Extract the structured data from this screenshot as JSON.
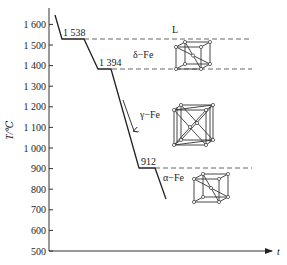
{
  "diagram": {
    "y_axis": {
      "label": "T/℃",
      "range": [
        500,
        1650
      ],
      "ticks": [
        {
          "value": 1600,
          "label": "1 600"
        },
        {
          "value": 1500,
          "label": "1 500"
        },
        {
          "value": 1400,
          "label": "1 400"
        },
        {
          "value": 1300,
          "label": "1 300"
        },
        {
          "value": 1200,
          "label": "1 200"
        },
        {
          "value": 1100,
          "label": "1 100"
        },
        {
          "value": 1000,
          "label": "1 000"
        },
        {
          "value": 900,
          "label": "900"
        },
        {
          "value": 800,
          "label": "800"
        },
        {
          "value": 700,
          "label": "700"
        },
        {
          "value": 600,
          "label": "600"
        },
        {
          "value": 500,
          "label": "500"
        }
      ]
    },
    "x_axis": {
      "label": "t"
    },
    "transitions": [
      {
        "temperature": 1538,
        "label": "1 538"
      },
      {
        "temperature": 1394,
        "label": "1 394"
      },
      {
        "temperature": 912,
        "label": "912"
      }
    ],
    "phases": [
      {
        "name": "L",
        "label": "L",
        "structure": "liquid"
      },
      {
        "name": "delta-fe",
        "label": "δ−Fe",
        "structure": "bcc"
      },
      {
        "name": "gamma-fe",
        "label": "γ−Fe",
        "structure": "fcc"
      },
      {
        "name": "alpha-fe",
        "label": "α−Fe",
        "structure": "bcc"
      }
    ],
    "cooling_direction": "down"
  }
}
